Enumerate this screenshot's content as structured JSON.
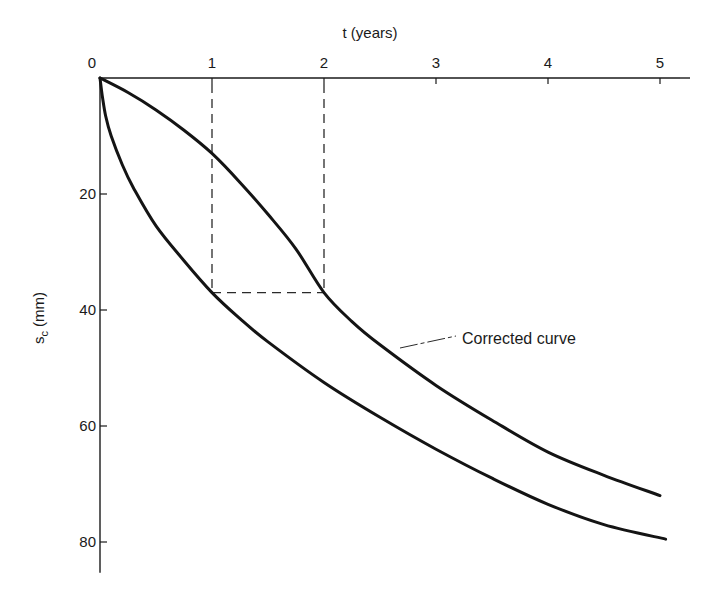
{
  "chart_data": {
    "type": "line",
    "title": "",
    "xlabel": "t (years)",
    "ylabel": "s_c (mm)",
    "xlabel_position": "top",
    "y_inverted": true,
    "xlim": [
      0,
      5.2
    ],
    "ylim": [
      0,
      86
    ],
    "x_ticks": [
      0,
      1,
      2,
      3,
      4,
      5
    ],
    "x_tick_labels": [
      "0",
      "1",
      "2",
      "3",
      "4",
      "5"
    ],
    "y_ticks": [
      20,
      40,
      60,
      80
    ],
    "y_tick_labels": [
      "20",
      "40",
      "60",
      "80"
    ],
    "grid": false,
    "legend": null,
    "series": [
      {
        "name": "Instantaneous-loading curve",
        "x": [
          0,
          0.02,
          0.05,
          0.1,
          0.2,
          0.3,
          0.5,
          0.75,
          1.0,
          1.25,
          1.5,
          2.0,
          2.5,
          3.0,
          3.5,
          4.0,
          4.5,
          5.05
        ],
        "y": [
          0,
          3,
          6.5,
          10,
          15,
          19,
          25.5,
          31.5,
          37,
          41.5,
          45.5,
          52.5,
          58.5,
          64,
          69,
          73.5,
          77,
          79.5
        ]
      },
      {
        "name": "Corrected curve",
        "x": [
          0,
          0.25,
          0.5,
          0.75,
          1.0,
          1.25,
          1.5,
          1.75,
          2.0,
          2.25,
          2.5,
          3.0,
          3.5,
          4.0,
          4.5,
          5.0
        ],
        "y": [
          0,
          2.5,
          5.5,
          9,
          13,
          18,
          23.5,
          29.5,
          37,
          42,
          46,
          53,
          59,
          64.5,
          68.5,
          72
        ]
      }
    ],
    "reference_lines": [
      {
        "type": "vertical",
        "x": 1,
        "y_range": [
          0,
          37
        ],
        "style": "dashed"
      },
      {
        "type": "vertical",
        "x": 2,
        "y_range": [
          0,
          37
        ],
        "style": "dashed"
      },
      {
        "type": "horizontal",
        "y": 37,
        "x_range": [
          1,
          2
        ],
        "style": "dashed"
      }
    ],
    "annotations": [
      {
        "text": "Corrected curve",
        "points_to": {
          "x": 2.7,
          "y": 48
        }
      }
    ]
  },
  "labels": {
    "x_axis_title": "t (years)",
    "y_axis_title_main": "s",
    "y_axis_title_sub": "c",
    "y_axis_title_unit": " (mm)",
    "origin": "0",
    "annotation": "Corrected curve"
  }
}
